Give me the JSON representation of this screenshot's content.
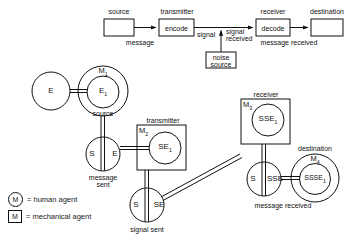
{
  "figure": {
    "stroke_color": "#111111",
    "background_color": "#ffffff"
  },
  "top_model": {
    "boxes": [
      {
        "id": "source",
        "label": "",
        "caption": "source"
      },
      {
        "id": "transmitter",
        "label": "encode",
        "caption": "transmitter"
      },
      {
        "id": "receiver",
        "label": "decode",
        "caption": "receiver"
      },
      {
        "id": "destination",
        "label": "",
        "caption": "destination"
      },
      {
        "id": "noise",
        "label": "noise\nsource",
        "caption": ""
      }
    ],
    "noise_line_1": "noise",
    "noise_line_2": "source",
    "edge_labels": [
      {
        "id": "message",
        "text": "message"
      },
      {
        "id": "signal",
        "text": "signal"
      },
      {
        "id": "signal-received-1",
        "text": "signal"
      },
      {
        "id": "signal-received-2",
        "text": "received"
      },
      {
        "id": "message-received",
        "text": "message received"
      }
    ]
  },
  "agent_model": {
    "nodes": [
      {
        "id": "e-plain",
        "label": "E",
        "kind": "circle"
      },
      {
        "id": "m1-outer",
        "label": "M",
        "sub": "1",
        "kind": "human-agent-circle"
      },
      {
        "id": "e1-inner",
        "label": "E",
        "sub": "1",
        "kind": "circle"
      },
      {
        "id": "se-split-1",
        "left": "S",
        "right": "E",
        "kind": "split-circle"
      },
      {
        "id": "m2-box",
        "label": "M",
        "sub": "2",
        "kind": "mechanical-agent-box"
      },
      {
        "id": "se1-inner",
        "label": "SE",
        "sub": "1",
        "kind": "circle"
      },
      {
        "id": "se-split-2",
        "left": "S",
        "right": "SE",
        "kind": "split-circle"
      },
      {
        "id": "m3-box",
        "label": "M",
        "sub": "3",
        "kind": "mechanical-agent-box"
      },
      {
        "id": "sse1-inner",
        "label": "SSE",
        "sub": "1",
        "kind": "circle"
      },
      {
        "id": "se-split-3",
        "left": "S",
        "right": "SSE",
        "kind": "split-circle"
      },
      {
        "id": "m4-outer",
        "label": "M",
        "sub": "4",
        "kind": "human-agent-circle"
      },
      {
        "id": "ssse1-inner",
        "label": "SSSE",
        "sub": "1",
        "kind": "circle"
      }
    ],
    "captions": [
      {
        "id": "caption-source",
        "text": "source"
      },
      {
        "id": "caption-transmitter",
        "text": "transmitter"
      },
      {
        "id": "caption-receiver",
        "text": "receiver"
      },
      {
        "id": "caption-destination",
        "text": "destination"
      },
      {
        "id": "caption-message-sent-1",
        "text": "message"
      },
      {
        "id": "caption-message-sent-2",
        "text": "sent"
      },
      {
        "id": "caption-signal-sent",
        "text": "signal sent"
      },
      {
        "id": "caption-message-received",
        "text": "message received"
      }
    ]
  },
  "legend": {
    "items": [
      {
        "glyph": "M",
        "shape": "circle",
        "text": "= human agent"
      },
      {
        "glyph": "M",
        "shape": "box",
        "text": "= mechanical agent"
      }
    ]
  }
}
